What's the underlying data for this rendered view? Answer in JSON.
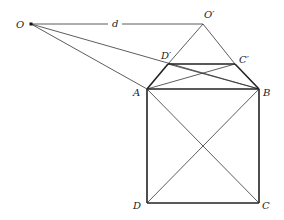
{
  "diagram": {
    "points": {
      "O": {
        "label": "O",
        "x": 31,
        "y": 24
      },
      "Op": {
        "label": "O′",
        "x": 203,
        "y": 24
      },
      "A": {
        "label": "A",
        "x": 147,
        "y": 89
      },
      "B": {
        "label": "B",
        "x": 259,
        "y": 89
      },
      "C": {
        "label": "C",
        "x": 259,
        "y": 203
      },
      "D": {
        "label": "D",
        "x": 147,
        "y": 203
      },
      "Dp": {
        "label": "D′",
        "x": 168,
        "y": 64
      },
      "Cp": {
        "label": "C′",
        "x": 235,
        "y": 64
      }
    },
    "distance_label": "d",
    "colors": {
      "line": "#222222",
      "background": "#ffffff"
    }
  }
}
